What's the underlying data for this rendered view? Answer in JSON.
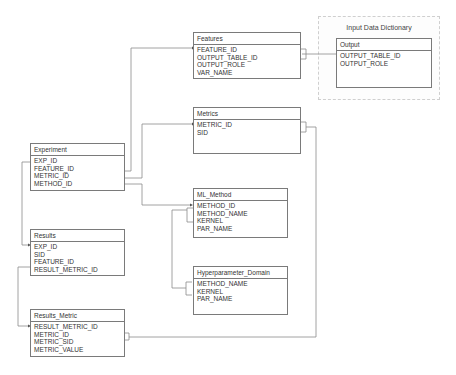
{
  "group": {
    "title": "Input Data Dictionary"
  },
  "entities": {
    "features": {
      "name": "Features",
      "attrs": [
        "FEATURE_ID",
        "OUTPUT_TABLE_ID",
        "OUTPUT_ROLE",
        "VAR_NAME"
      ]
    },
    "output": {
      "name": "Output",
      "attrs": [
        "OUTPUT_TABLE_ID",
        "OUTPUT_ROLE"
      ]
    },
    "metrics": {
      "name": "Metrics",
      "attrs": [
        "METRIC_ID",
        "SID"
      ]
    },
    "experiment": {
      "name": "Experiment",
      "attrs": [
        "EXP_ID",
        "FEATURE_ID",
        "METRIC_ID",
        "METHOD_ID"
      ]
    },
    "ml_method": {
      "name": "ML_Method",
      "attrs": [
        "METHOD_ID",
        "METHOD_NAME",
        "KERNEL",
        "PAR_NAME"
      ]
    },
    "results": {
      "name": "Results",
      "attrs": [
        "EXP_ID",
        "SID",
        "FEATURE_ID",
        "RESULT_METRIC_ID"
      ]
    },
    "hyperparameter_domain": {
      "name": "Hyperparameter_Domain",
      "attrs": [
        "METHOD_NAME",
        "KERNEL",
        "PAR_NAME"
      ]
    },
    "results_metric": {
      "name": "Results_Metric",
      "attrs": [
        "RESULT_METRIC_ID",
        "METRIC_ID",
        "METRIC_SID",
        "METRIC_VALUE"
      ]
    }
  },
  "relationships": [
    {
      "from": "Experiment.FEATURE_ID",
      "to": "Features.FEATURE_ID"
    },
    {
      "from": "Experiment.METRIC_ID",
      "to": "Metrics.METRIC_ID"
    },
    {
      "from": "Experiment.METHOD_ID",
      "to": "ML_Method.METHOD_ID"
    },
    {
      "from": "Experiment.EXP_ID",
      "to": "Results.EXP_ID"
    },
    {
      "from": "Results.RESULT_METRIC_ID",
      "to": "Results_Metric.RESULT_METRIC_ID"
    },
    {
      "from": "Features.OUTPUT_TABLE_ID/OUTPUT_ROLE",
      "to": "Output.OUTPUT_TABLE_ID/OUTPUT_ROLE"
    },
    {
      "from": "Metrics.METRIC_ID/SID",
      "to": "Results_Metric.METRIC_ID/METRIC_SID"
    },
    {
      "from": "ML_Method.METHOD_NAME/KERNEL/PAR_NAME",
      "to": "Hyperparameter_Domain.METHOD_NAME/KERNEL/PAR_NAME"
    }
  ]
}
